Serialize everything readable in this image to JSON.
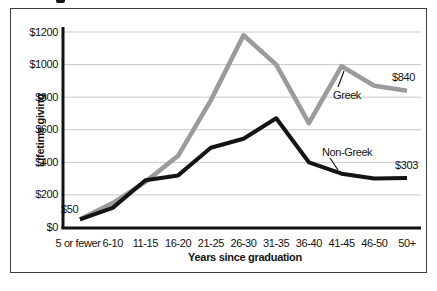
{
  "chart_data": {
    "type": "line",
    "title": "",
    "xlabel": "Years since graduation",
    "ylabel": "Lifetime giving",
    "categories": [
      "5 or fewer",
      "6-10",
      "11-15",
      "16-20",
      "21-25",
      "26-30",
      "31-35",
      "36-40",
      "41-45",
      "46-50",
      "50+"
    ],
    "series": [
      {
        "name": "Greek",
        "color": "#9b9b9b",
        "stroke_width": 4.6,
        "values": [
          50,
          150,
          280,
          440,
          780,
          1180,
          1000,
          640,
          990,
          870,
          840
        ]
      },
      {
        "name": "Non-Greek",
        "color": "#141414",
        "stroke_width": 4.0,
        "values": [
          50,
          120,
          290,
          320,
          490,
          545,
          670,
          400,
          330,
          300,
          303
        ]
      }
    ],
    "ylim": [
      0,
      1200
    ],
    "yticks": [
      {
        "value": 0,
        "label": "$0"
      },
      {
        "value": 200,
        "label": "$200"
      },
      {
        "value": 400,
        "label": "$400"
      },
      {
        "value": 600,
        "label": "$600"
      },
      {
        "value": 800,
        "label": "$800"
      },
      {
        "value": 1000,
        "label": "$1000"
      },
      {
        "value": 1200,
        "label": "$1200"
      }
    ],
    "grid": "horizontal",
    "grid_color": "#c9c9c9",
    "axis_color": "#121212",
    "legend": "none (series labeled by inline annotations)",
    "annotations": [
      {
        "text": "$50",
        "x": 61,
        "y": 203,
        "refers_to": "starting value of both lines at 5 or fewer years"
      },
      {
        "text": "Greek",
        "x": 333,
        "y": 89,
        "refers_to": "gray line",
        "leader": [
          [
            338,
            87
          ],
          [
            344,
            71
          ]
        ]
      },
      {
        "text": "$840",
        "x": 392,
        "y": 71,
        "refers_to": "Greek value at 50+"
      },
      {
        "text": "Non-Greek",
        "x": 322,
        "y": 146,
        "refers_to": "black line",
        "leader": [
          [
            330,
            158
          ],
          [
            338,
            170
          ]
        ]
      },
      {
        "text": "$303",
        "x": 395,
        "y": 159,
        "refers_to": "Non-Greek value at 50+"
      }
    ]
  }
}
